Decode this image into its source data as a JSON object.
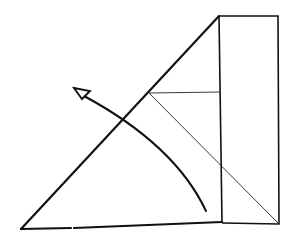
{
  "diagram": {
    "type": "origami-fold-step",
    "colors": {
      "line": "#111111",
      "background": "#ffffff"
    },
    "elements": {
      "main_triangle": {
        "points": [
          [
            21,
            229
          ],
          [
            219,
            16
          ],
          [
            222,
            222
          ]
        ]
      },
      "right_flap": {
        "points": [
          [
            219,
            16
          ],
          [
            278,
            16
          ],
          [
            279,
            224
          ],
          [
            222,
            224
          ]
        ]
      },
      "horizontal_crease": {
        "from": [
          149,
          93
        ],
        "to": [
          221,
          92
        ]
      },
      "diagonal_crease": {
        "from": [
          149,
          93
        ],
        "to": [
          279,
          224
        ]
      },
      "fold_arrow": {
        "path_start": [
          206,
          211
        ],
        "path_end": [
          83,
          95
        ],
        "head_tip": [
          74,
          88
        ],
        "head_style": "hollow"
      }
    }
  }
}
